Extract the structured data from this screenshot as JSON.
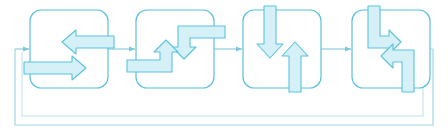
{
  "diagram": {
    "type": "process-flow-loop",
    "title": "",
    "canvas": {
      "width": 448,
      "height": 137,
      "background": "#ffffff"
    },
    "colors": {
      "stroke": "#5bc0de",
      "arrow_stroke": "#58c3dd",
      "arrow_fill": "#d6f0f8",
      "box_stroke": "#5bc0de",
      "box_fill": "#ffffff",
      "connector": "#7ec8dd"
    },
    "stages": [
      {
        "id": "stage-1",
        "label": "",
        "x": 30,
        "y": 10,
        "width": 78,
        "height": 78,
        "glyphs": [
          {
            "name": "arrow-left-top",
            "direction": "left",
            "style": "straight"
          },
          {
            "name": "arrow-right-bottom",
            "direction": "right",
            "style": "straight"
          }
        ]
      },
      {
        "id": "stage-2",
        "label": "",
        "x": 136,
        "y": 10,
        "width": 78,
        "height": 78,
        "glyphs": [
          {
            "name": "arrow-elbow-right-to-down",
            "direction": "down",
            "style": "elbow"
          },
          {
            "name": "arrow-elbow-left-to-up",
            "direction": "up",
            "style": "elbow"
          }
        ]
      },
      {
        "id": "stage-3",
        "label": "",
        "x": 243,
        "y": 10,
        "width": 78,
        "height": 78,
        "glyphs": [
          {
            "name": "arrow-down-top",
            "direction": "down",
            "style": "straight"
          },
          {
            "name": "arrow-up-bottom",
            "direction": "up",
            "style": "straight"
          }
        ]
      },
      {
        "id": "stage-4",
        "label": "",
        "x": 352,
        "y": 10,
        "width": 78,
        "height": 78,
        "glyphs": [
          {
            "name": "arrow-elbow-down-to-right",
            "direction": "right",
            "style": "elbow"
          },
          {
            "name": "arrow-elbow-up-to-left",
            "direction": "left",
            "style": "elbow"
          }
        ]
      }
    ],
    "connectors": [
      {
        "name": "connector-in-to-stage-1",
        "from": "feedback-loop",
        "to": "stage-1",
        "arrowhead": true
      },
      {
        "name": "connector-stage-1-to-stage-2",
        "from": "stage-1",
        "to": "stage-2",
        "arrowhead": true
      },
      {
        "name": "connector-stage-2-to-stage-3",
        "from": "stage-2",
        "to": "stage-3",
        "arrowhead": true
      },
      {
        "name": "connector-stage-3-to-stage-4",
        "from": "stage-3",
        "to": "stage-4",
        "arrowhead": true
      },
      {
        "name": "feedback-loop",
        "from": "stage-4",
        "to": "stage-1",
        "arrowhead": false
      }
    ]
  }
}
